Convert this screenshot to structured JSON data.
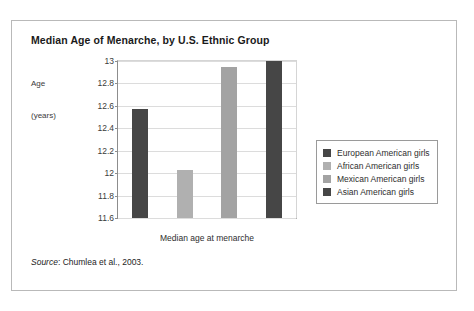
{
  "figure": {
    "title": "Median Age of Menarche, by U.S. Ethnic Group",
    "y_axis_caption_line1": "Age",
    "y_axis_caption_line2": "(years)",
    "x_axis_caption": "Median age at menarche",
    "source_word": "Source",
    "source_rest": ": Chumlea et al., 2003."
  },
  "colors": {
    "dark_bar": "#464646",
    "light_bar": "#b0b0b0",
    "mid_bar": "#a3a3a3",
    "axis": "#8d8d8d",
    "grid": "#dcdcdc",
    "frame": "#b9b9b9",
    "legend_border": "#9a9a9a",
    "text": "#2e2e2e"
  },
  "chart_data": {
    "type": "bar",
    "title": "Median Age of Menarche, by U.S. Ethnic Group",
    "xlabel": "Median age at menarche",
    "ylabel": "Age (years)",
    "ylim": [
      11.6,
      13
    ],
    "yticks": [
      "11.6",
      "11.8",
      "12",
      "12.2",
      "12.4",
      "12.6",
      "12.8",
      "13"
    ],
    "ytick_values": [
      11.6,
      11.8,
      12,
      12.2,
      12.4,
      12.6,
      12.8,
      13
    ],
    "grid": true,
    "legend_position": "right",
    "categories": [
      "European American girls",
      "African American girls",
      "Mexican American girls",
      "Asian American girls"
    ],
    "values": [
      12.57,
      12.03,
      12.95,
      13.0
    ],
    "bar_colors": [
      "#464646",
      "#b0b0b0",
      "#a3a3a3",
      "#464646"
    ],
    "series": [
      {
        "name": "Median age at menarche",
        "values": [
          12.57,
          12.03,
          12.95,
          13.0
        ]
      }
    ],
    "legend": [
      {
        "label": "European American girls",
        "color": "#464646"
      },
      {
        "label": "African American girls",
        "color": "#b0b0b0"
      },
      {
        "label": "Mexican American girls",
        "color": "#a3a3a3"
      },
      {
        "label": "Asian American girls",
        "color": "#464646"
      }
    ],
    "source": "Source: Chumlea et al., 2003."
  }
}
